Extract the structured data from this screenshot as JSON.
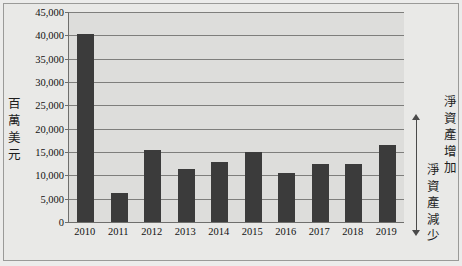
{
  "chart_data": {
    "type": "bar",
    "title": "",
    "subtitle": "",
    "xlabel": "",
    "ylabel": "百萬美元",
    "categories": [
      "2010",
      "2011",
      "2012",
      "2013",
      "2014",
      "2015",
      "2016",
      "2017",
      "2018",
      "2019"
    ],
    "values": [
      40200,
      6200,
      15400,
      11300,
      12900,
      14900,
      10600,
      12400,
      12400,
      16400
    ],
    "ylim": [
      0,
      45000
    ],
    "ytick_values": [
      0,
      5000,
      10000,
      15000,
      20000,
      25000,
      30000,
      35000,
      40000,
      45000
    ],
    "ytick_labels": [
      "0",
      "5,000",
      "10,000",
      "15,000",
      "20,000",
      "25,000",
      "30,000",
      "35,000",
      "40,000",
      "45,000"
    ],
    "grid": true,
    "legend": "none",
    "bar_color": "#3b3b3b",
    "plot_background": "#dddddb",
    "gridline_color": "#7e7e7c"
  },
  "y_axis": {
    "title_chars": [
      "百",
      "萬",
      "美",
      "元"
    ]
  },
  "annotation": {
    "increase_chars": [
      "淨",
      "資",
      "產",
      "增",
      "加"
    ],
    "decrease_chars": [
      "淨",
      "資",
      "產",
      "減",
      "少"
    ],
    "arrow": "double-headed-vertical-arrow"
  }
}
